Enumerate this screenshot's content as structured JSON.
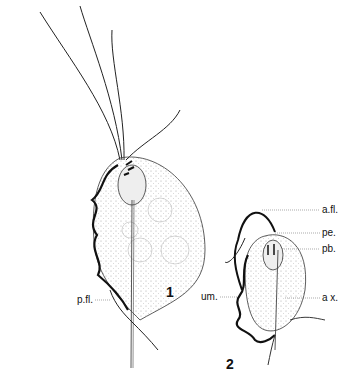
{
  "figures": [
    {
      "number": "1",
      "labels": [
        {
          "id": "p-fl",
          "text": "p.fl."
        }
      ]
    },
    {
      "number": "2",
      "labels": [
        {
          "id": "a-fl",
          "text": "a.fl."
        },
        {
          "id": "pe",
          "text": "pe."
        },
        {
          "id": "pb",
          "text": "pb."
        },
        {
          "id": "um",
          "text": "um."
        },
        {
          "id": "ax",
          "text": "a x."
        }
      ]
    }
  ],
  "colors": {
    "ink": "#111111",
    "background": "#ffffff",
    "stipple": "#888888"
  }
}
